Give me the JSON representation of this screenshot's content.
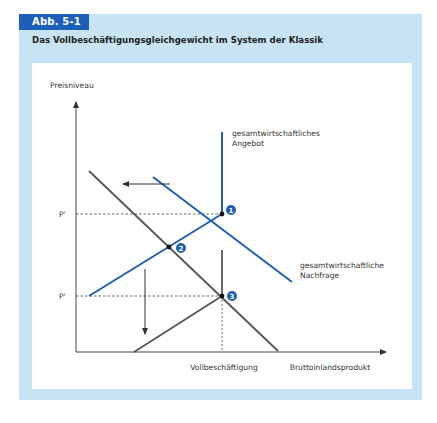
{
  "figure": {
    "number": "Abb. 5-1",
    "title": "Das Vollbeschäftigungsgleichgewicht im System der Klassik"
  },
  "diagram": {
    "y_axis_label": "Preisniveau",
    "x_axis_label": "Bruttoinlandsprodukt",
    "x_marker_label": "Vollbeschäftigung",
    "price_levels": [
      {
        "label": "P'",
        "id": "p1"
      },
      {
        "label": "P'",
        "id": "p2"
      }
    ],
    "curves": {
      "supply_label_line1": "gesamtwirtschaftliches",
      "supply_label_line2": "Angebot",
      "demand_label_line1": "gesamtwirtschaftliche",
      "demand_label_line2": "Nachfrage"
    },
    "equilibrium_points": [
      "1",
      "2",
      "3"
    ],
    "colors": {
      "blue": "#1f5fb6",
      "grey": "#555555",
      "frame": "#c6e4f4",
      "badge": "#1d5fb8"
    }
  }
}
